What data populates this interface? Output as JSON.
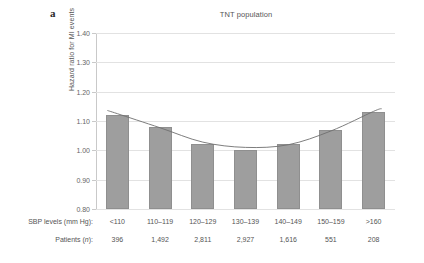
{
  "panel": {
    "label": "a"
  },
  "chart_data": {
    "type": "bar",
    "title": "TNT population",
    "xlabel": "SBP levels (mm Hg):",
    "ylabel": "Hazard ratio for MI events",
    "ylim": [
      0.8,
      1.4
    ],
    "ytick_labels": [
      "1.40",
      "1.30",
      "1.20",
      "1.10",
      "1.00",
      "0.90",
      "0.80"
    ],
    "ytick_values": [
      1.4,
      1.3,
      1.2,
      1.1,
      1.0,
      0.9,
      0.8
    ],
    "grid": true,
    "legend": "none",
    "categories": [
      "<110",
      "110–119",
      "120–129",
      "130–139",
      "140–149",
      "150–159",
      ">160"
    ],
    "values": [
      1.12,
      1.08,
      1.02,
      1.0,
      1.02,
      1.07,
      1.13
    ],
    "series": [
      {
        "name": "Hazard ratio for MI events",
        "type": "bar",
        "values": [
          1.12,
          1.08,
          1.02,
          1.0,
          1.02,
          1.07,
          1.13
        ]
      },
      {
        "name": "Fitted spline",
        "type": "line",
        "values": [
          1.125,
          1.077,
          1.028,
          1.01,
          1.019,
          1.066,
          1.133
        ]
      }
    ],
    "patients_label": "Patients (n):",
    "patients": [
      "396",
      "1,492",
      "2,811",
      "2,927",
      "1,616",
      "551",
      "208"
    ],
    "colors": {
      "bar": "#9e9e9e",
      "bar_edge": "#8f8f8f",
      "grid": "#e2e2e2",
      "axis": "#c9c9c9",
      "curve": "#6f6f6f",
      "text": "#555555"
    }
  }
}
